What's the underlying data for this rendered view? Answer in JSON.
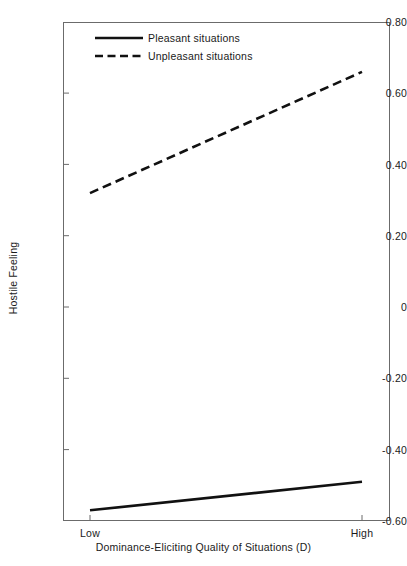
{
  "chart_data": {
    "type": "line",
    "title": "",
    "xlabel": "Dominance-Eliciting Quality of Situations (D)",
    "ylabel": "Hostile Feeling",
    "x": [
      "Low",
      "High"
    ],
    "xtick_labels": [
      "Low",
      "High"
    ],
    "ytick_labels": [
      "0.80",
      "0.60",
      "0.40",
      "0.20",
      "0",
      "-0.20",
      "-0.40",
      "-0.60"
    ],
    "ytick_values": [
      0.8,
      0.6,
      0.4,
      0.2,
      0,
      -0.2,
      -0.4,
      -0.6
    ],
    "ylim": [
      -0.6,
      0.8
    ],
    "grid": false,
    "legend_position": "upper-left-inside",
    "series": [
      {
        "name": "Pleasant situations",
        "style": "solid",
        "color": "#111111",
        "values": [
          -0.57,
          -0.49
        ]
      },
      {
        "name": "Unpleasant situations",
        "style": "dashed",
        "color": "#111111",
        "values": [
          0.32,
          0.66
        ]
      }
    ]
  },
  "axes": {
    "y_title": "Hostile Feeling",
    "x_title": "Dominance-Eliciting Quality of Situations (D)",
    "y_ticks": [
      {
        "label": "0.80",
        "value": 0.8
      },
      {
        "label": "0.60",
        "value": 0.6
      },
      {
        "label": "0.40",
        "value": 0.4
      },
      {
        "label": "0.20",
        "value": 0.2
      },
      {
        "label": "0",
        "value": 0
      },
      {
        "label": "-0.20",
        "value": -0.2
      },
      {
        "label": "-0.40",
        "value": -0.4
      },
      {
        "label": "-0.60",
        "value": -0.6
      }
    ],
    "x_ticks": [
      {
        "label": "Low"
      },
      {
        "label": "High"
      }
    ]
  },
  "legend": {
    "items": [
      {
        "label": "Pleasant situations",
        "style": "solid"
      },
      {
        "label": "Unpleasant situations",
        "style": "dashed"
      }
    ]
  },
  "colors": {
    "background": "#ffffff",
    "frame": "#6b6b6b",
    "line": "#111111",
    "text": "#1a1a1a"
  }
}
